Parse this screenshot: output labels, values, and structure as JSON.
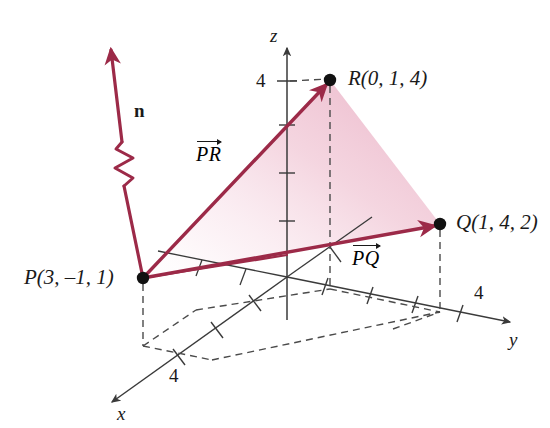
{
  "figure": {
    "type": "3d-vector-diagram",
    "background_color": "#ffffff",
    "vector_color": "#9c2a48",
    "plane_fill_color": "#f2c9d8",
    "axis_color": "#3a3a3a",
    "point_color": "#111111",
    "label_color": "#1a1a1a"
  },
  "axes": {
    "z": {
      "label": "z",
      "tick_label": "4"
    },
    "y": {
      "label": "y",
      "tick_label": "4"
    },
    "x": {
      "label": "x",
      "tick_label": "4"
    }
  },
  "points": [
    {
      "id": "P",
      "label": "P(3, –1, 1)",
      "name": "P",
      "coords": [
        3,
        -1,
        1
      ]
    },
    {
      "id": "R",
      "label": "R(0, 1, 4)",
      "name": "R",
      "coords": [
        0,
        1,
        4
      ]
    },
    {
      "id": "Q",
      "label": "Q(1, 4, 2)",
      "name": "Q",
      "coords": [
        1,
        4,
        2
      ]
    }
  ],
  "vectors": [
    {
      "id": "PR",
      "label": "PR",
      "from": "P",
      "to": "R",
      "style": "over-arrow"
    },
    {
      "id": "PQ",
      "label": "PQ",
      "from": "P",
      "to": "Q",
      "style": "over-arrow"
    },
    {
      "id": "n",
      "label": "n",
      "from": "P",
      "to": "normal-tip",
      "style": "bold-upright"
    }
  ],
  "plane": {
    "name": "plane PQR",
    "shaded": true
  }
}
